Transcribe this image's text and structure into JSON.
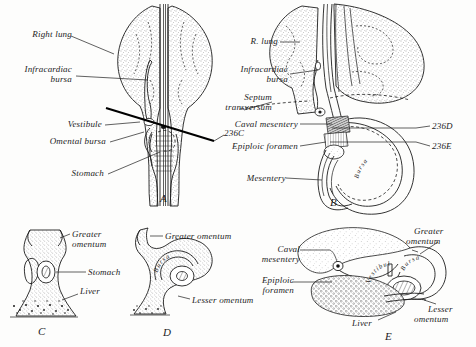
{
  "figure": {
    "panels": [
      {
        "id": "A",
        "letter": "A",
        "labels": [
          {
            "name": "right-lung",
            "text": "Right lung"
          },
          {
            "name": "infracardiac-bursa",
            "text": "Infracardiac\nbursa"
          },
          {
            "name": "vestibule",
            "text": "Vestibule"
          },
          {
            "name": "omental-bursa",
            "text": "Omental bursa"
          },
          {
            "name": "stomach",
            "text": "Stomach"
          },
          {
            "name": "section-level-236c",
            "text": "236C"
          }
        ]
      },
      {
        "id": "B",
        "letter": "B",
        "labels": [
          {
            "name": "r-lung",
            "text": "R. lung"
          },
          {
            "name": "infracardiac-bursa",
            "text": "Infracardiac\nbursa"
          },
          {
            "name": "septum-transversum",
            "text": "Septum\ntransversum"
          },
          {
            "name": "caval-mesentery",
            "text": "Caval mesentery"
          },
          {
            "name": "epiploic-foramen",
            "text": "Epiploic foramen"
          },
          {
            "name": "mesentery",
            "text": "Mesentery"
          },
          {
            "name": "bursa-curved",
            "text": "Bursa"
          },
          {
            "name": "section-level-236d",
            "text": "236D"
          },
          {
            "name": "section-level-236e",
            "text": "236E"
          }
        ]
      },
      {
        "id": "C",
        "letter": "C",
        "labels": [
          {
            "name": "greater-omentum",
            "text": "Greater\nomentum"
          },
          {
            "name": "stomach",
            "text": "Stomach"
          },
          {
            "name": "liver",
            "text": "Liver"
          }
        ]
      },
      {
        "id": "D",
        "letter": "D",
        "labels": [
          {
            "name": "greater-omentum",
            "text": "Greater omentum"
          },
          {
            "name": "lesser-omentum",
            "text": "Lesser omentum"
          },
          {
            "name": "bursa-curved",
            "text": "Bursa"
          }
        ]
      },
      {
        "id": "E",
        "letter": "E",
        "labels": [
          {
            "name": "caval-mesentery",
            "text": "Caval\nmesentery"
          },
          {
            "name": "epiploic-foramen",
            "text": "Epiploic\nforamen"
          },
          {
            "name": "vestibule-curved",
            "text": "Vestibule"
          },
          {
            "name": "bursa-curved",
            "text": "Bursa"
          },
          {
            "name": "greater-omentum",
            "text": "Greater\nomentum"
          },
          {
            "name": "lesser-omentum",
            "text": "Lesser\nomentum"
          },
          {
            "name": "liver",
            "text": "Liver"
          }
        ]
      }
    ]
  },
  "labels": {
    "a_right_lung": "Right lung",
    "a_infracardiac_bursa_1": "Infracardiac",
    "a_infracardiac_bursa_2": "bursa",
    "a_vestibule": "Vestibule",
    "a_omental_bursa": "Omental bursa",
    "a_stomach": "Stomach",
    "a_236c": "236C",
    "a_letter": "A",
    "b_r_lung": "R. lung",
    "b_infracardiac_bursa_1": "Infracardiac",
    "b_infracardiac_bursa_2": "bursa",
    "b_septum_1": "Septum",
    "b_septum_2": "transversum",
    "b_caval_mesentery": "Caval mesentery",
    "b_epiploic_foramen": "Epiploic foramen",
    "b_mesentery": "Mesentery",
    "b_bursa": "Bursa",
    "b_236d": "236D",
    "b_236e": "236E",
    "b_letter": "B",
    "c_greater_1": "Greater",
    "c_greater_2": "omentum",
    "c_stomach": "Stomach",
    "c_liver": "Liver",
    "c_letter": "C",
    "d_greater": "Greater omentum",
    "d_lesser": "Lesser omentum",
    "d_bursa": "Bursa",
    "d_letter": "D",
    "e_caval_1": "Caval",
    "e_caval_2": "mesentery",
    "e_epiploic_1": "Epiploic",
    "e_epiploic_2": "foramen",
    "e_vestibule": "Vestibule",
    "e_bursa": "Bursa",
    "e_greater_1": "Greater",
    "e_greater_2": "omentum",
    "e_lesser_1": "Lesser",
    "e_lesser_2": "omentum",
    "e_liver": "Liver",
    "e_letter": "E"
  },
  "colors": {
    "ink": "#1d1d1d",
    "paper": "#fdfdfc",
    "stipple": "#4a4a4a"
  }
}
